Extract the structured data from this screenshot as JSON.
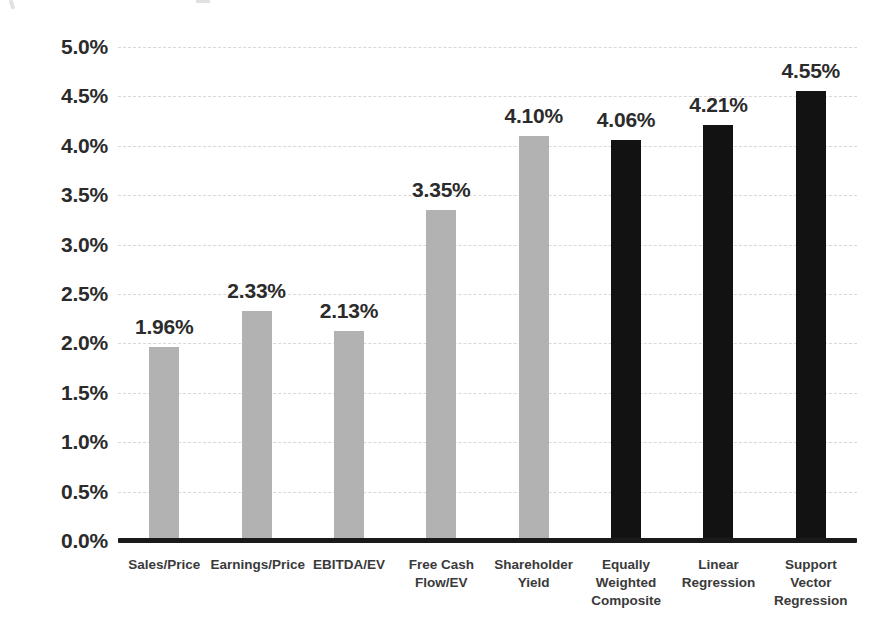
{
  "chart_data": {
    "type": "bar",
    "title": "",
    "subtitle": "",
    "xlabel": "",
    "ylabel": "",
    "ylim": [
      0,
      5
    ],
    "ytick_step": 0.5,
    "grid": true,
    "legend": "none",
    "value_format": "percent",
    "categories": [
      "Sales/Price",
      "Earnings/Price",
      "EBITDA/EV",
      "Free Cash\nFlow/EV",
      "Shareholder\nYield",
      "Equally\nWeighted\nComposite",
      "Linear\nRegression",
      "Support\nVector\nRegression"
    ],
    "values": [
      1.96,
      2.33,
      2.13,
      3.35,
      4.1,
      4.06,
      4.21,
      4.55
    ],
    "data_labels": [
      "1.96%",
      "2.33%",
      "2.13%",
      "3.35%",
      "4.10%",
      "4.06%",
      "4.21%",
      "4.55%"
    ],
    "bar_colors": [
      "#b2b2b2",
      "#b2b2b2",
      "#b2b2b2",
      "#b2b2b2",
      "#b2b2b2",
      "#121212",
      "#121212",
      "#121212"
    ],
    "ytick_labels": [
      "5.0%",
      "4.5%",
      "4.0%",
      "3.5%",
      "3.0%",
      "2.5%",
      "2.0%",
      "1.5%",
      "1.0%",
      "0.5%",
      "0.0%"
    ],
    "ytick_values": [
      5.0,
      4.5,
      4.0,
      3.5,
      3.0,
      2.5,
      2.0,
      1.5,
      1.0,
      0.5,
      0.0
    ]
  },
  "style": {
    "background": "#ffffff",
    "grid_color": "#d8d8d8",
    "axis_color": "#1a1a1a",
    "text_color": "#2b2b2b",
    "category_text_color": "#3a3a3a",
    "grey_series_color": "#b2b2b2",
    "black_series_color": "#121212"
  }
}
